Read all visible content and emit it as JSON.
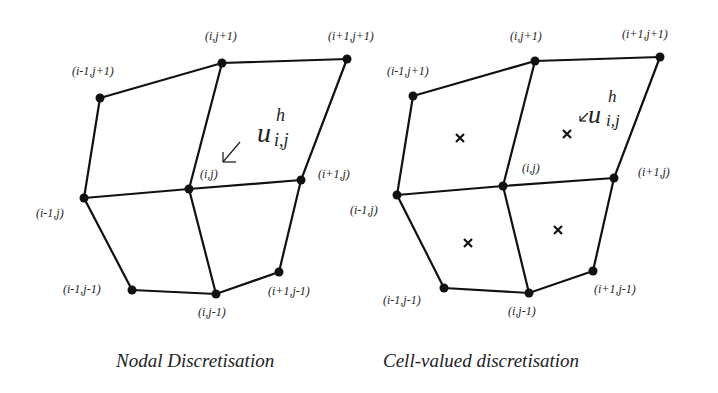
{
  "panels": [
    {
      "caption": "Nodal Discretisation",
      "variable": {
        "base": "u",
        "superscript": "h",
        "subscript": "i,j"
      },
      "nodes": [
        {
          "label": "(i-1,j+1)"
        },
        {
          "label": "(i,j+1)"
        },
        {
          "label": "(i+1,j+1)"
        },
        {
          "label": "(i-1,j)"
        },
        {
          "label": "(i,j)"
        },
        {
          "label": "(i+1,j)"
        },
        {
          "label": "(i-1,j-1)"
        },
        {
          "label": "(i,j-1)"
        },
        {
          "label": "(i+1,j-1)"
        }
      ]
    },
    {
      "caption": "Cell-valued discretisation",
      "variable": {
        "base": "u",
        "superscript": "h",
        "subscript": "i,j"
      },
      "nodes": [
        {
          "label": "(i-1,j+1)"
        },
        {
          "label": "(i,j+1)"
        },
        {
          "label": "(i+1,j+1)"
        },
        {
          "label": "(i-1,j)"
        },
        {
          "label": "(i,j)"
        },
        {
          "label": "(i+1,j)"
        },
        {
          "label": "(i-1,j-1)"
        },
        {
          "label": "(i,j-1)"
        },
        {
          "label": "(i+1,j-1)"
        }
      ],
      "cell_centers": 4
    }
  ]
}
